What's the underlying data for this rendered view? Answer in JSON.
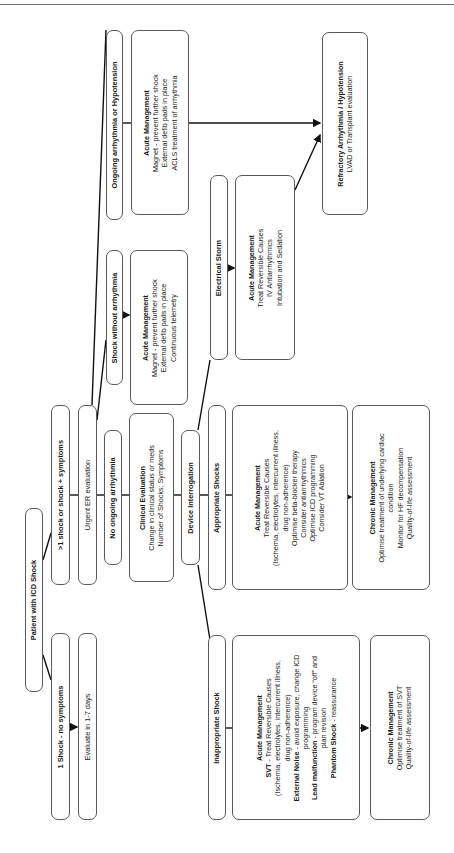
{
  "diagram": {
    "title_node": "Patient with ICD Shock",
    "branch_low": {
      "label": "1 Shock - no symptoms",
      "action": "Evaluate in 1-7 days"
    },
    "branch_high": {
      "label": ">1 shock or shock + symptoms",
      "action": "Urgent ER evaluation"
    },
    "no_ongoing": {
      "label": "No ongoing arrhythmia",
      "clinical_eval": {
        "title": "Clinical Evaluation",
        "lines": [
          "Change in clinical status or meds",
          "Number of Shocks; Symptoms"
        ]
      },
      "device_interrogation": "Device Interrogation"
    },
    "appropriate": {
      "label": "Appropriate Shocks",
      "acute": {
        "title": "Acute Management",
        "lines": [
          "Treat Reversible Causes",
          "(Ischemia, electrolytes, intercurrent illness,",
          "drug non-adherence)",
          "Optimise beta-blocker therapy",
          "Consider antiarrhythmics",
          "Optimise ICD programming",
          "Consider VT Ablation"
        ]
      },
      "chronic": {
        "title": "Chronic Management",
        "lines": [
          "Optimise treatment of underlying cardiac",
          "condition",
          "Monitor for HF decompensation",
          "Quality-of-life assessment"
        ]
      }
    },
    "inappropriate": {
      "label": "Inappropriate Shock",
      "acute": {
        "title": "Acute Management",
        "lines": [
          {
            "bold": "SVT",
            "text": " - Treat Reversible Causes"
          },
          {
            "bold": "",
            "text": "(Ischemia, electrolytes, intercurrent illness,"
          },
          {
            "bold": "",
            "text": "drug non-adherence)"
          },
          {
            "bold": "External Noise",
            "text": " - avoid exposure, change ICD"
          },
          {
            "bold": "",
            "text": "programming"
          },
          {
            "bold": "Lead malfunction",
            "text": " - program device “off” and"
          },
          {
            "bold": "",
            "text": "plan revision"
          },
          {
            "bold": "Phantom Shock",
            "text": " - reassurance"
          }
        ]
      },
      "chronic": {
        "title": "Chronic Management",
        "lines": [
          "Optimise treatment of SVT",
          "Quality-of-life assessment"
        ]
      }
    },
    "shock_without_arrhythmia": {
      "label": "Shock without arrhythmia",
      "acute": {
        "title": "Acute Management",
        "lines": [
          "Magnet - prevent further shock",
          "External defib pads in place",
          "Continuous telemetry"
        ]
      }
    },
    "ongoing_arrhythmia": {
      "label": "Ongoing arrhythmia or Hypotension",
      "acute": {
        "title": "Acute Management",
        "lines": [
          "Magnet - prevent further shock",
          "External defib pads in place",
          "ACLS treatment of arrhythmia"
        ]
      }
    },
    "electrical_storm": {
      "label": "Electrical Storm",
      "acute": {
        "title": "Acute Management",
        "lines": [
          "Treat Reversible Causes",
          "IV Antiarrhythmics",
          "Intubation and Sedation"
        ]
      }
    },
    "refractory": {
      "title": "Refractory Arrhythmia / Hypotension",
      "lines": [
        "LVAD or Transplant evaluation"
      ]
    }
  }
}
